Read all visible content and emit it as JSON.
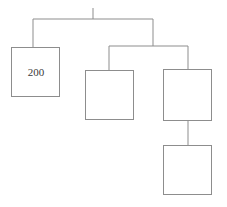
{
  "diagram": {
    "type": "tree-chart",
    "background_color": "#ffffff",
    "line_color": "#8d8d8d",
    "line_width": 1,
    "box_fill": "#ffffff",
    "box_stroke": "#8d8d8d",
    "text_color": "#3a3a3a",
    "nodes": [
      {
        "id": "node-left",
        "name": "left-node",
        "label": "200",
        "x": 11,
        "y": 47,
        "width": 49,
        "height": 50
      },
      {
        "id": "node-middle",
        "name": "middle-node",
        "label": "",
        "x": 85,
        "y": 70,
        "width": 49,
        "height": 50
      },
      {
        "id": "node-right",
        "name": "right-node",
        "label": "",
        "x": 163,
        "y": 69,
        "width": 49,
        "height": 52
      },
      {
        "id": "node-bottom",
        "name": "bottom-node",
        "label": "",
        "x": 163,
        "y": 145,
        "width": 49,
        "height": 50
      }
    ],
    "connectors": [
      {
        "id": "root-stub",
        "name": "root-stub-connector",
        "points": "93,8 93,19"
      },
      {
        "id": "top-bar",
        "name": "top-horizontal-connector",
        "points": "33,19 153,19"
      },
      {
        "id": "top-left-drop",
        "name": "top-left-drop-connector",
        "points": "33,19 33,47"
      },
      {
        "id": "top-right-drop",
        "name": "top-right-drop-connector",
        "points": "153,19 153,46"
      },
      {
        "id": "second-bar",
        "name": "second-horizontal-connector",
        "points": "109,46 188,46"
      },
      {
        "id": "middle-drop",
        "name": "middle-drop-connector",
        "points": "109,46 109,70"
      },
      {
        "id": "right-drop",
        "name": "right-drop-connector",
        "points": "188,46 188,69"
      },
      {
        "id": "bottom-drop",
        "name": "bottom-drop-connector",
        "points": "188,121 188,145"
      }
    ]
  }
}
